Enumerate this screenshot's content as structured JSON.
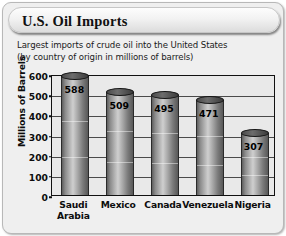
{
  "card": {
    "title": "U.S. Oil Imports",
    "subtitle_line1": "Largest imports of crude oil into the United States",
    "subtitle_line2": "(by country of origin in millions of barrels)"
  },
  "chart_data": {
    "type": "bar",
    "title": "U.S. Oil Imports",
    "subtitle": "Largest imports of crude oil into the United States (by country of origin in millions of barrels)",
    "categories": [
      "Saudi Arabia",
      "Mexico",
      "Canada",
      "Venezuela",
      "Nigeria"
    ],
    "category_lines": [
      [
        "Saudi",
        "Arabia"
      ],
      [
        "Mexico"
      ],
      [
        "Canada"
      ],
      [
        "Venezuela"
      ],
      [
        "Nigeria"
      ]
    ],
    "values": [
      588,
      509,
      495,
      471,
      307
    ],
    "xlabel": "",
    "ylabel": "Millions of Barrels",
    "ylim": [
      0,
      600
    ],
    "ytick_labels": [
      "600",
      "500",
      "400",
      "300",
      "200",
      "100",
      "0"
    ],
    "ytick_values": [
      600,
      500,
      400,
      300,
      200,
      100,
      0
    ],
    "grid": true,
    "legend": "none",
    "colors": {
      "plot_background": "#e9e9e9",
      "card_background": "#efefef",
      "bar_light": "#cfcfcf",
      "bar_dark": "#585858",
      "axis": "#111111"
    }
  }
}
